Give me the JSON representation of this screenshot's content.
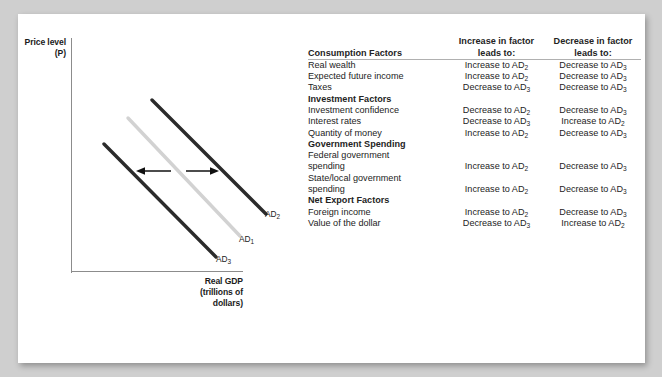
{
  "chart": {
    "y_axis_label_lines": [
      "Price level",
      "(P)"
    ],
    "x_axis_label_lines": [
      "Real GDP",
      "(trillions of",
      "dollars)"
    ],
    "curves": [
      {
        "id": "AD2",
        "label": "AD",
        "subscript": "2",
        "color": "#2b2b2b",
        "position": "right"
      },
      {
        "id": "AD1",
        "label": "AD",
        "subscript": "1",
        "color": "#d2d2d2",
        "position": "middle"
      },
      {
        "id": "AD3",
        "label": "AD",
        "subscript": "3",
        "color": "#2b2b2b",
        "position": "left"
      }
    ],
    "arrows": [
      {
        "id": "shift-left-arrow",
        "direction": "left",
        "meaning": "decrease in aggregate demand"
      },
      {
        "id": "shift-right-arrow",
        "direction": "right",
        "meaning": "increase in aggregate demand"
      }
    ],
    "axis_color": "#8c8c8c"
  },
  "table": {
    "headers": {
      "factor": "Consumption Factors",
      "increase_lines": [
        "Increase in factor",
        "leads to:"
      ],
      "decrease_lines": [
        "Decrease in factor",
        "leads to:"
      ]
    },
    "rows": [
      {
        "type": "item",
        "factor": "Real wealth",
        "factor2": "",
        "increase": "Increase to AD",
        "increase_sub": "2",
        "decrease": "Decrease to AD",
        "decrease_sub": "3"
      },
      {
        "type": "item",
        "factor": "Expected future income",
        "factor2": "",
        "increase": "Increase to AD",
        "increase_sub": "2",
        "decrease": "Decrease to AD",
        "decrease_sub": "3"
      },
      {
        "type": "item",
        "factor": "Taxes",
        "factor2": "",
        "increase": "Decrease to AD",
        "increase_sub": "3",
        "decrease": "Decrease to AD",
        "decrease_sub": "3"
      },
      {
        "type": "group",
        "factor": "Investment Factors",
        "factor2": "",
        "increase": "",
        "increase_sub": "",
        "decrease": "",
        "decrease_sub": ""
      },
      {
        "type": "item",
        "factor": "Investment confidence",
        "factor2": "",
        "increase": "Decrease to AD",
        "increase_sub": "2",
        "decrease": "Decrease to AD",
        "decrease_sub": "3"
      },
      {
        "type": "item",
        "factor": "Interest rates",
        "factor2": "",
        "increase": "Decrease to AD",
        "increase_sub": "3",
        "decrease": "Increase to AD",
        "decrease_sub": "2"
      },
      {
        "type": "item",
        "factor": "Quantity of money",
        "factor2": "",
        "increase": "Increase to AD",
        "increase_sub": "2",
        "decrease": "Decrease to AD",
        "decrease_sub": "3"
      },
      {
        "type": "group",
        "factor": "Government Spending",
        "factor2": "",
        "increase": "",
        "increase_sub": "",
        "decrease": "",
        "decrease_sub": ""
      },
      {
        "type": "item",
        "factor": "Federal government",
        "factor2": "spending",
        "increase": "Increase to AD",
        "increase_sub": "2",
        "decrease": "Decrease to AD",
        "decrease_sub": "3"
      },
      {
        "type": "item",
        "factor": "State/local government",
        "factor2": "spending",
        "increase": "Increase to AD",
        "increase_sub": "2",
        "decrease": "Decrease to AD",
        "decrease_sub": "3"
      },
      {
        "type": "group",
        "factor": "Net Export Factors",
        "factor2": "",
        "increase": "",
        "increase_sub": "",
        "decrease": "",
        "decrease_sub": ""
      },
      {
        "type": "item",
        "factor": "Foreign income",
        "factor2": "",
        "increase": "Increase to AD",
        "increase_sub": "2",
        "decrease": "Decrease to AD",
        "decrease_sub": "3"
      },
      {
        "type": "item",
        "factor": "Value of the dollar",
        "factor2": "",
        "increase": "Decrease to AD",
        "increase_sub": "3",
        "decrease": "Increase to AD",
        "decrease_sub": "2"
      }
    ]
  }
}
